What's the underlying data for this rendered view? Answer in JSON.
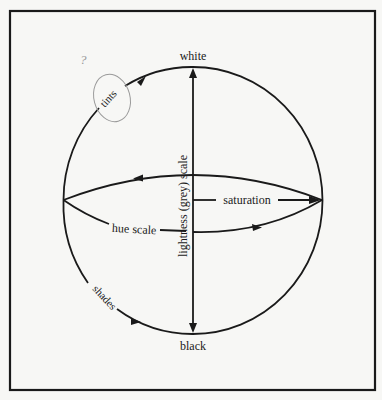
{
  "diagram": {
    "type": "colour-sphere",
    "labels": {
      "top": "white",
      "bottom": "black",
      "tints": "tints",
      "shades": "shades",
      "hue": "hue scale",
      "saturation": "saturation",
      "lightness": "lightness (grey) scale"
    },
    "annotations": {
      "question_mark": "?",
      "circled_label": "tints"
    },
    "colors": {
      "ink": "#1a1a1a",
      "paper": "#f7f7f5",
      "pencil": "#9a9a9a"
    }
  }
}
